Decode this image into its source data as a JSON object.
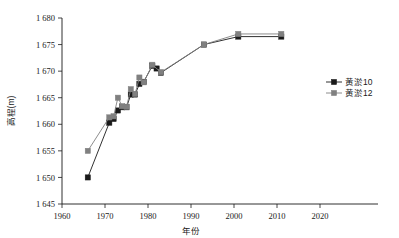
{
  "chart_data": {
    "type": "line",
    "title": "",
    "xlabel": "年份",
    "ylabel": "高程(m)",
    "xlim": [
      1960,
      2020
    ],
    "ylim": [
      1645,
      1680
    ],
    "xticks": [
      "1960",
      "1970",
      "1980",
      "1990",
      "2000",
      "2010",
      "2020"
    ],
    "xtick_values": [
      1960,
      1970,
      1980,
      1990,
      2000,
      2010,
      2020
    ],
    "yticks": [
      "1 645",
      "1 650",
      "1 655",
      "1 660",
      "1 665",
      "1 670",
      "1 675",
      "1 680"
    ],
    "ytick_values": [
      1645,
      1650,
      1655,
      1660,
      1665,
      1670,
      1675,
      1680
    ],
    "grid": false,
    "legend_position": "right",
    "series": [
      {
        "name": "黄淤10",
        "color": "#1a1a1a",
        "marker": "square",
        "x": [
          1966,
          1971,
          1972,
          1973,
          1974,
          1975,
          1976,
          1977,
          1978,
          1979,
          1981,
          1982,
          1983,
          1993,
          2001,
          2011
        ],
        "y": [
          1650.0,
          1660.3,
          1661.0,
          1662.6,
          1663.2,
          1663.2,
          1665.6,
          1665.6,
          1667.6,
          1668.0,
          1671.0,
          1670.5,
          1669.7,
          1675.0,
          1676.5,
          1676.5
        ]
      },
      {
        "name": "黄淤12",
        "color": "#808080",
        "marker": "square",
        "x": [
          1966,
          1971,
          1972,
          1973,
          1974,
          1975,
          1976,
          1977,
          1978,
          1979,
          1981,
          1983,
          1993,
          2001,
          2011
        ],
        "y": [
          1655.0,
          1661.3,
          1661.5,
          1665.0,
          1663.4,
          1663.3,
          1666.6,
          1665.7,
          1668.8,
          1667.9,
          1671.2,
          1669.8,
          1675.0,
          1677.0,
          1677.0
        ]
      }
    ]
  },
  "legend": {
    "items": [
      {
        "label": "黄淤10",
        "color": "#1a1a1a"
      },
      {
        "label": "黄淤12",
        "color": "#808080"
      }
    ]
  },
  "axes": {
    "y_title": "高程(m)",
    "x_title": "年份"
  }
}
